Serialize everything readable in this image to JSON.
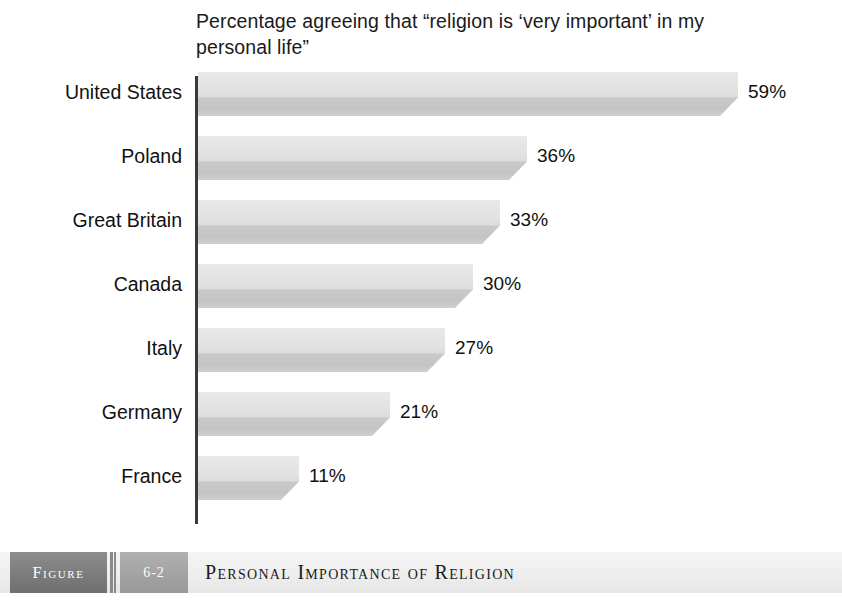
{
  "chart_data": {
    "type": "bar",
    "orientation": "horizontal",
    "title": "Percentage agreeing that “religion is ‘very important’ in my personal life”",
    "xlabel": "",
    "ylabel": "",
    "xlim": [
      0,
      59
    ],
    "grid": false,
    "legend": null,
    "categories": [
      "United States",
      "Poland",
      "Great Britain",
      "Canada",
      "Italy",
      "Germany",
      "France"
    ],
    "values": [
      59,
      36,
      33,
      30,
      27,
      21,
      11
    ],
    "value_labels": [
      "59%",
      "36%",
      "33%",
      "30%",
      "27%",
      "21%",
      "11%"
    ],
    "bars": [
      {
        "category": "United States",
        "value": 59,
        "label": "59%"
      },
      {
        "category": "Poland",
        "value": 36,
        "label": "36%"
      },
      {
        "category": "Great Britain",
        "value": 33,
        "label": "33%"
      },
      {
        "category": "Canada",
        "value": 30,
        "label": "30%"
      },
      {
        "category": "Italy",
        "value": 27,
        "label": "27%"
      },
      {
        "category": "Germany",
        "value": 21,
        "label": "21%"
      },
      {
        "category": "France",
        "value": 11,
        "label": "11%"
      }
    ],
    "colors": {
      "bar_face": "#e2e2e2",
      "bar_shadow": "#c4c4c4",
      "axis": "#3a3a3a",
      "text": "#111111",
      "background": "#ffffff"
    }
  },
  "caption": {
    "figure_word": "Figure",
    "figure_number": "6-2",
    "figure_title": "Personal Importance of Religion",
    "colors": {
      "figure_word_box": "#7e7e7e",
      "figure_number_box": "#a4a4a4",
      "bar_background": "#eeeeee"
    }
  }
}
